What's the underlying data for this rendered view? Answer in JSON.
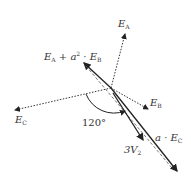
{
  "diagram": {
    "type": "phasor-diagram",
    "angle_label": "120°",
    "vectors": [
      {
        "name": "E_A",
        "label_main": "E",
        "label_sub": "A",
        "style": "dotted"
      },
      {
        "name": "E_B",
        "label_main": "E",
        "label_sub": "B",
        "style": "dotted"
      },
      {
        "name": "E_C",
        "label_main": "E",
        "label_sub": "C",
        "style": "dotted"
      },
      {
        "name": "E_A + a^2·E_B",
        "label": "E_A + a² · E_B",
        "style": "solid"
      },
      {
        "name": "a·E_C",
        "label": "a · E_C",
        "style": "solid"
      },
      {
        "name": "3V_2",
        "label": "3V₂",
        "style": "solid"
      }
    ],
    "labels": {
      "ea_main": "E",
      "ea_sub": "A",
      "eb_main": "E",
      "eb_sub": "B",
      "ec_main": "E",
      "ec_sub": "C",
      "sum_e1": "E",
      "sum_s1": "A",
      "sum_plus": " + a",
      "sum_sup": "2",
      "sum_dot": " · E",
      "sum_s2": "B",
      "aec_a": "a · E",
      "aec_sub": "C",
      "v2_main": "3V",
      "v2_sub": "2",
      "angle": "120°"
    }
  }
}
